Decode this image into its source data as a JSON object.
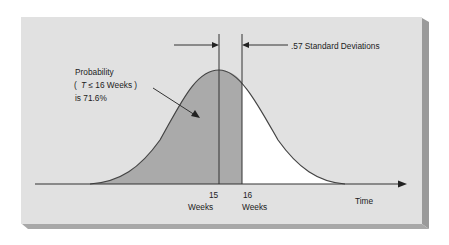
{
  "diagram": {
    "annotation": {
      "line1": "Probability",
      "line2_open": "(",
      "line2_var": "T",
      "line2_rest": "≤ 16 Weeks )",
      "line3": "is 71.6%"
    },
    "std_dev_label": ".57 Standard Deviations",
    "x_axis": {
      "label": "Time",
      "ticks": [
        {
          "value": "15",
          "unit": "Weeks"
        },
        {
          "value": "16",
          "unit": "Weeks"
        }
      ]
    },
    "probability_percent": 71.6,
    "std_deviations": 0.57,
    "mean_weeks": 15,
    "target_weeks": 16
  },
  "colors": {
    "panel": "#e1e1e1",
    "panel_shadow": "#9a9a9a",
    "shaded_area": "#aaaaaa",
    "unshaded_area": "#ffffff",
    "lines": "#333333"
  }
}
